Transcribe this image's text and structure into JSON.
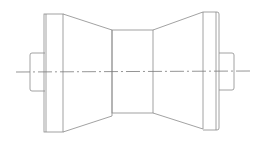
{
  "drawing": {
    "title": "",
    "subject": "roller (spool) side view line drawing",
    "colors": {
      "background": "#ffffff",
      "line": "#8a8a8a",
      "centerline": "#7a7a7a"
    },
    "parts": [
      "left-shaft",
      "left-flange",
      "left-cone",
      "center-cylinder",
      "right-cone",
      "right-flange",
      "right-shaft",
      "centerline"
    ]
  }
}
